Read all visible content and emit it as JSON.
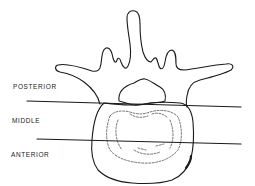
{
  "diagram": {
    "labels": {
      "posterior": "POSTERIOR",
      "middle": "MIDDLE",
      "anterior": "ANTERIOR"
    },
    "colors": {
      "stroke": "#1a1a1a",
      "background": "#ffffff"
    }
  }
}
